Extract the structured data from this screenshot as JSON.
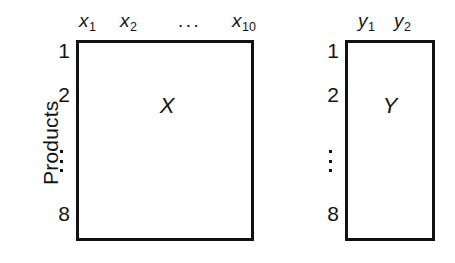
{
  "figure": {
    "type": "matrix-block-diagram",
    "background_color": "#ffffff",
    "line_color": "#111111",
    "axis_title": "Products"
  },
  "matrices": {
    "x": {
      "name": "X",
      "column_headers": [
        "x1",
        "x2",
        "x10"
      ],
      "column_header_display": [
        "x",
        "x",
        "x"
      ],
      "column_subscripts": [
        "1",
        "2",
        "10"
      ],
      "column_ellipsis": "...",
      "row_labels": [
        "1",
        "2",
        "8"
      ],
      "row_ellipsis": "vertical-dots",
      "rows": 8,
      "columns": 10
    },
    "y": {
      "name": "Y",
      "column_headers": [
        "y1",
        "y2"
      ],
      "column_header_display": [
        "y",
        "y"
      ],
      "column_subscripts": [
        "1",
        "2"
      ],
      "row_labels": [
        "1",
        "2",
        "8"
      ],
      "row_ellipsis": "vertical-dots",
      "rows": 8,
      "columns": 2
    }
  },
  "labels": {
    "x_var": "x",
    "y_var": "y",
    "sub_1": "1",
    "sub_2": "2",
    "sub_10": "10",
    "ellipsis_h": "...",
    "row_1": "1",
    "row_2": "2",
    "row_8": "8",
    "matrix_x": "X",
    "matrix_y": "Y",
    "products": "Products"
  }
}
